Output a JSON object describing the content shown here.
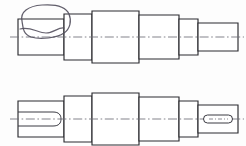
{
  "drawing": {
    "title": "Stepped Shaft",
    "description": "Two-view orthographic engineering drawing of a stepped cylindrical shaft",
    "background_color": "#fdfdfd",
    "line_color": "#2b2b30",
    "centerline_color": "#6d6d76",
    "annotation_color": "#54505e",
    "canvas": {
      "width": 246,
      "height": 146
    },
    "views": [
      {
        "id": "top-view",
        "name": "Top Elevation View",
        "centerline_y": 37,
        "has_annotation": true,
        "annotation": {
          "type": "freehand-loop",
          "name": "hand-drawn-circle-annotation",
          "target": "left-end-step",
          "color": "#54505e"
        },
        "left_end_feature": "squiggle-break-line",
        "right_end_feature": "plain-boss",
        "sections": [
          {
            "name": "step-1-left-end",
            "x": 18,
            "width": 46,
            "half_height": 18
          },
          {
            "name": "step-2",
            "x": 64,
            "width": 28,
            "half_height": 23
          },
          {
            "name": "step-3-largest",
            "x": 92,
            "width": 47,
            "half_height": 26
          },
          {
            "name": "step-4",
            "x": 139,
            "width": 40,
            "half_height": 22
          },
          {
            "name": "step-5",
            "x": 179,
            "width": 19,
            "half_height": 18
          },
          {
            "name": "step-6-right-end",
            "x": 198,
            "width": 40,
            "half_height": 14
          }
        ]
      },
      {
        "id": "bottom-view",
        "name": "Bottom Elevation View",
        "centerline_y": 119,
        "has_annotation": false,
        "left_end_feature": "open-keyway-slot",
        "right_end_feature": "obround-slot",
        "sections": [
          {
            "name": "step-1-left-end",
            "x": 18,
            "width": 46,
            "half_height": 18
          },
          {
            "name": "step-2",
            "x": 64,
            "width": 28,
            "half_height": 23
          },
          {
            "name": "step-3-largest",
            "x": 92,
            "width": 47,
            "half_height": 26
          },
          {
            "name": "step-4",
            "x": 139,
            "width": 40,
            "half_height": 22
          },
          {
            "name": "step-5",
            "x": 179,
            "width": 19,
            "half_height": 18
          },
          {
            "name": "step-6-right-end",
            "x": 198,
            "width": 40,
            "half_height": 14
          }
        ],
        "keyway": {
          "name": "left-open-keyway",
          "x": 18,
          "y_top": 112,
          "y_bottom": 126,
          "end_x": 60,
          "rounded_end": true
        },
        "obround_slot": {
          "name": "right-obround-slot",
          "cx": 218,
          "cy": 119,
          "length": 29,
          "height": 8,
          "corner_radius": 4,
          "has_centerline": true
        }
      }
    ]
  }
}
